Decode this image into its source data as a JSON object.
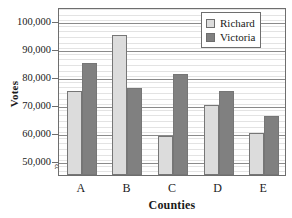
{
  "chart_data": {
    "type": "bar",
    "title": "",
    "xlabel": "Counties",
    "ylabel": "Votes",
    "categories": [
      "A",
      "B",
      "C",
      "D",
      "E"
    ],
    "series": [
      {
        "name": "Richard",
        "color": "#dcdcdc",
        "values": [
          75000,
          95000,
          59000,
          70000,
          60000
        ]
      },
      {
        "name": "Victoria",
        "color": "#808080",
        "values": [
          85000,
          76000,
          81000,
          75000,
          66000
        ]
      }
    ],
    "ylim": [
      45000,
      105000
    ],
    "y_ticks": [
      50000,
      60000,
      70000,
      80000,
      90000,
      100000
    ],
    "y_tick_labels": [
      "50,000",
      "60,000",
      "70,000",
      "80,000",
      "90,000",
      "100,000"
    ],
    "minor_tick_step": 2000,
    "grid": true,
    "axis_break": "≈",
    "legend_position": "top-right",
    "legend": [
      "Richard",
      "Victoria"
    ]
  }
}
